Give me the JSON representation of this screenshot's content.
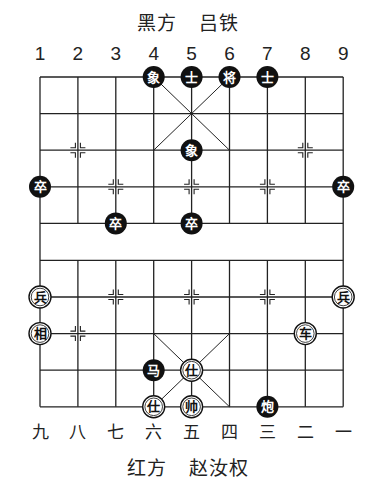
{
  "header": {
    "side": "黑方",
    "player": "吕铁"
  },
  "footer": {
    "side": "红方",
    "player": "赵汝权"
  },
  "top_column_labels": [
    "1",
    "2",
    "3",
    "4",
    "5",
    "6",
    "7",
    "8",
    "9"
  ],
  "bottom_column_labels": [
    "九",
    "八",
    "七",
    "六",
    "五",
    "四",
    "三",
    "二",
    "一"
  ],
  "colors": {
    "black_piece": "#111111",
    "red_piece_fill": "#ffffff",
    "line": "#222222"
  },
  "pieces": [
    {
      "side": "black",
      "label": "象",
      "col": 4,
      "row": 0
    },
    {
      "side": "black",
      "label": "士",
      "col": 5,
      "row": 0
    },
    {
      "side": "black",
      "label": "将",
      "col": 6,
      "row": 0
    },
    {
      "side": "black",
      "label": "士",
      "col": 7,
      "row": 0
    },
    {
      "side": "black",
      "label": "象",
      "col": 5,
      "row": 2
    },
    {
      "side": "black",
      "label": "卒",
      "col": 1,
      "row": 3
    },
    {
      "side": "black",
      "label": "卒",
      "col": 9,
      "row": 3
    },
    {
      "side": "black",
      "label": "卒",
      "col": 3,
      "row": 4
    },
    {
      "side": "black",
      "label": "卒",
      "col": 5,
      "row": 4
    },
    {
      "side": "red",
      "label": "兵",
      "col": 1,
      "row": 6
    },
    {
      "side": "red",
      "label": "兵",
      "col": 9,
      "row": 6
    },
    {
      "side": "red",
      "label": "相",
      "col": 1,
      "row": 7
    },
    {
      "side": "red",
      "label": "车",
      "col": 8,
      "row": 7
    },
    {
      "side": "black",
      "label": "马",
      "col": 4,
      "row": 8
    },
    {
      "side": "red",
      "label": "仕",
      "col": 5,
      "row": 8
    },
    {
      "side": "red",
      "label": "仕",
      "col": 4,
      "row": 9
    },
    {
      "side": "red",
      "label": "帅",
      "col": 5,
      "row": 9
    },
    {
      "side": "black",
      "label": "炮",
      "col": 7,
      "row": 9
    }
  ],
  "markers": [
    {
      "col": 2,
      "row": 2
    },
    {
      "col": 8,
      "row": 2
    },
    {
      "col": 3,
      "row": 3
    },
    {
      "col": 5,
      "row": 3
    },
    {
      "col": 7,
      "row": 3
    },
    {
      "col": 3,
      "row": 6
    },
    {
      "col": 5,
      "row": 6
    },
    {
      "col": 7,
      "row": 6
    },
    {
      "col": 2,
      "row": 7
    }
  ]
}
